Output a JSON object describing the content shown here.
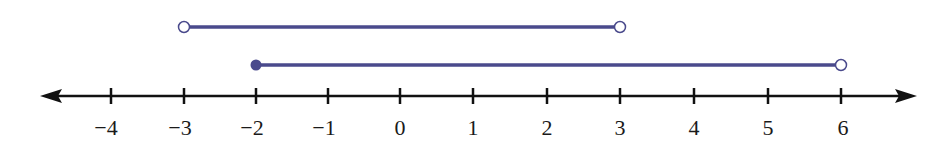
{
  "diagram": {
    "type": "number-line",
    "colors": {
      "axis": "#111111",
      "interval": "#4a4a8c",
      "open_fill": "#ffffff"
    },
    "axis": {
      "min": -4,
      "max": 6,
      "arrows": "both"
    },
    "ticks": [
      {
        "value": -4,
        "label": "−4",
        "x": 111
      },
      {
        "value": -3,
        "label": "−3",
        "x": 184
      },
      {
        "value": -2,
        "label": "−2",
        "x": 256
      },
      {
        "value": -1,
        "label": "−1",
        "x": 328
      },
      {
        "value": 0,
        "label": "0",
        "x": 400
      },
      {
        "value": 1,
        "label": "1",
        "x": 473
      },
      {
        "value": 2,
        "label": "2",
        "x": 547
      },
      {
        "value": 3,
        "label": "3",
        "x": 620
      },
      {
        "value": 4,
        "label": "4",
        "x": 694
      },
      {
        "value": 5,
        "label": "5",
        "x": 768
      },
      {
        "value": 6,
        "label": "6",
        "x": 841
      }
    ],
    "intervals": [
      {
        "name": "upper",
        "from": -3,
        "to": 3,
        "left": "open",
        "right": "open",
        "notation": "(-3, 3)"
      },
      {
        "name": "lower",
        "from": -2,
        "to": 6,
        "left": "closed",
        "right": "open",
        "notation": "[-2, 6)"
      }
    ]
  }
}
